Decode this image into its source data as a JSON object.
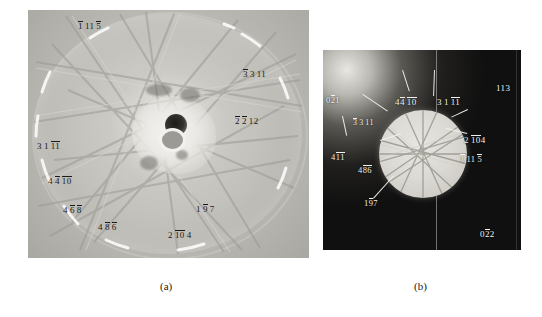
{
  "figure": {
    "type": "electron-diffraction-kikuchi-patterns",
    "panels": [
      {
        "id": "a",
        "caption": "(a)"
      },
      {
        "id": "b",
        "caption": "(b)"
      }
    ]
  },
  "panel_a": {
    "labels": [
      {
        "id": "a1",
        "text": "1 11 5",
        "bars": [
          0,
          0,
          1
        ],
        "groups": [
          "1",
          "11",
          "5"
        ],
        "x": 78,
        "y": 22
      },
      {
        "id": "a2",
        "text": "3 3 11",
        "bars": [
          1,
          0,
          0
        ],
        "groups": [
          "3",
          "3",
          "11"
        ],
        "x": 243,
        "y": 70
      },
      {
        "id": "a3",
        "text": "2 2 12",
        "bars": [
          1,
          1,
          0
        ],
        "groups": [
          "2",
          "2",
          "12"
        ],
        "x": 235,
        "y": 117
      },
      {
        "id": "a4",
        "text": "3 1 11",
        "bars": [
          0,
          0,
          1
        ],
        "groups": [
          "3",
          "1",
          "11"
        ],
        "x": 37,
        "y": 142
      },
      {
        "id": "a5",
        "text": "4 4 10",
        "bars": [
          0,
          1,
          1
        ],
        "groups": [
          "4",
          "4",
          "10"
        ],
        "x": 48,
        "y": 177
      },
      {
        "id": "a6",
        "text": "4 6 8",
        "bars": [
          0,
          1,
          1
        ],
        "groups": [
          "4",
          "6",
          "8"
        ],
        "x": 63,
        "y": 206
      },
      {
        "id": "a7",
        "text": "4 8 6",
        "bars": [
          0,
          1,
          1
        ],
        "groups": [
          "4",
          "8",
          "6"
        ],
        "x": 98,
        "y": 223
      },
      {
        "id": "a8",
        "text": "1 9 7",
        "bars": [
          0,
          1,
          0
        ],
        "groups": [
          "1",
          "9",
          "7"
        ],
        "x": 196,
        "y": 205
      },
      {
        "id": "a9",
        "text": "2 10 4",
        "bars": [
          0,
          1,
          0
        ],
        "groups": [
          "2",
          "10",
          "4"
        ],
        "x": 168,
        "y": 231
      }
    ]
  },
  "panel_b": {
    "labels": [
      {
        "id": "b1",
        "text": "022 1",
        "bars": [
          0,
          1,
          0
        ],
        "groups": [
          "0",
          "2",
          "1"
        ],
        "x": 326,
        "y": 96,
        "tone": "light"
      },
      {
        "id": "b2",
        "text": "113",
        "bars": [
          0,
          0,
          0
        ],
        "groups": [
          "113"
        ],
        "x": 496,
        "y": 84,
        "tone": "light"
      },
      {
        "id": "b3",
        "text": "3 3 11",
        "bars": [
          1,
          0,
          0
        ],
        "groups": [
          "3",
          "3",
          "11"
        ],
        "x": 353,
        "y": 119,
        "tone": "light"
      },
      {
        "id": "b4",
        "text": "4 4 10",
        "bars": [
          0,
          1,
          1
        ],
        "groups": [
          "4",
          "4",
          "10"
        ],
        "x": 395,
        "y": 98,
        "tone": "light"
      },
      {
        "id": "b5",
        "text": "3 1 11",
        "bars": [
          0,
          0,
          1
        ],
        "groups": [
          "3",
          "1",
          "11"
        ],
        "x": 437,
        "y": 98,
        "tone": "light"
      },
      {
        "id": "b6",
        "text": "2 10 4",
        "bars": [
          0,
          1,
          0
        ],
        "groups": [
          "2",
          "10",
          "4"
        ],
        "x": 464,
        "y": 136,
        "tone": "light"
      },
      {
        "id": "b7",
        "text": "1 11 5",
        "bars": [
          1,
          0,
          1
        ],
        "groups": [
          "1",
          "11",
          "5"
        ],
        "x": 460,
        "y": 155,
        "tone": "light"
      },
      {
        "id": "b8",
        "text": "4 1 1",
        "bars": [
          0,
          1,
          1
        ],
        "groups": [
          "4",
          "1",
          "1"
        ],
        "x": 331,
        "y": 153,
        "tone": "light"
      },
      {
        "id": "b9",
        "text": "4 8 6",
        "bars": [
          0,
          1,
          1
        ],
        "groups": [
          "4",
          "8",
          "6"
        ],
        "x": 358,
        "y": 166,
        "tone": "light"
      },
      {
        "id": "b10",
        "text": "1 9 7",
        "bars": [
          0,
          1,
          0
        ],
        "groups": [
          "1",
          "9",
          "7"
        ],
        "x": 364,
        "y": 199,
        "tone": "light"
      },
      {
        "id": "b11",
        "text": "022 2",
        "bars": [
          0,
          1,
          0
        ],
        "groups": [
          "0",
          "2",
          "2"
        ],
        "x": 480,
        "y": 230,
        "tone": "light"
      }
    ]
  },
  "captions": {
    "panel_a": "(a)",
    "panel_b": "(b)"
  },
  "colors": {
    "page_background": "#ffffff",
    "panel_a_background": "#c8c6c1",
    "panel_b_background": "#0d0d0d",
    "label_dark": "#1b1a18",
    "label_light": "#f3f2ef"
  }
}
